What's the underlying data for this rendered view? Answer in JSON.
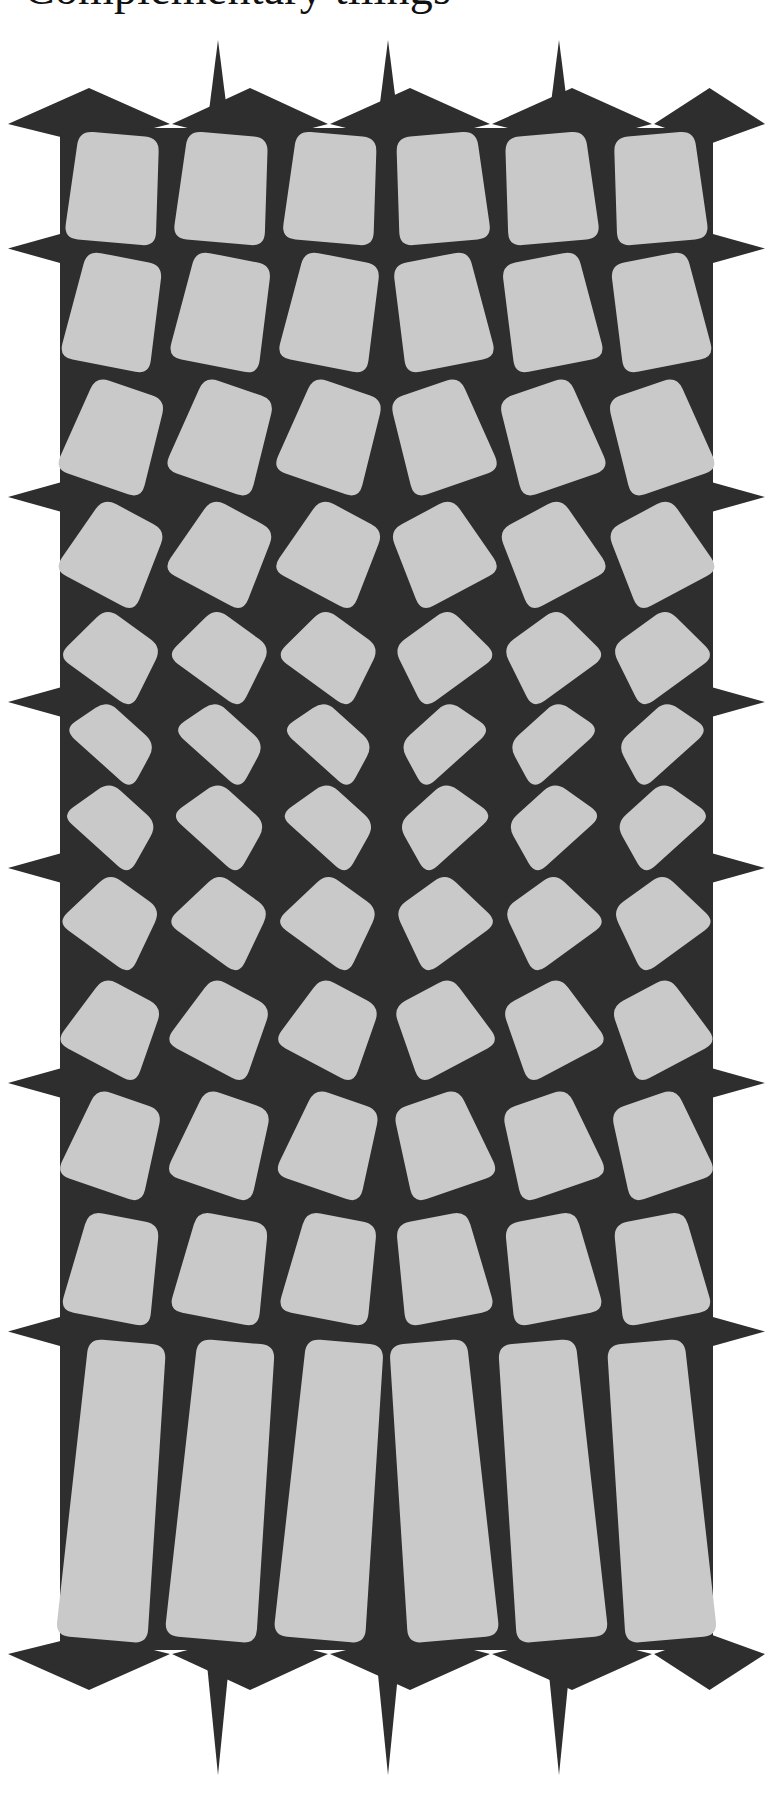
{
  "page": {
    "width": 773,
    "height": 1808,
    "background_color": "#ffffff"
  },
  "header": {
    "running_title": "Complementary tilings",
    "clipped": true,
    "note": "Only the bottom few pixels of the serif title line are visible at the top edge of the page."
  },
  "figure": {
    "name": "complementary-tiling-diagram",
    "colors": {
      "tile": "#c9c9c9",
      "ground": "#2e2e2e",
      "page": "#ffffff"
    },
    "geometry": {
      "columns": 6,
      "rows": 12,
      "block_left": 60,
      "block_right": 713,
      "block_top": 128,
      "block_bottom": 1650,
      "tile_corner_radius": 14,
      "vertical_symmetry_axis_y": 889,
      "horizontal_symmetry_axis_x": 386,
      "max_tile_rotation_deg": 42,
      "min_tile_rotation_deg": 4,
      "top_spike_count": 3,
      "top_spike_x": [
        218,
        388,
        559
      ],
      "top_spike_tip_y": 40,
      "bottom_spike_count": 3,
      "bottom_spike_x": [
        218,
        388,
        559
      ],
      "bottom_spike_tip_y": 1775,
      "side_diamond_count_per_side": 6,
      "left_diamond_tip_x": 8,
      "right_diamond_tip_x": 765
    },
    "chart_data": {
      "type": "diagram",
      "title": "Complementary tilings",
      "rows": 12,
      "columns": 6,
      "row_tilt_degrees": [
        5,
        11,
        19,
        28,
        36,
        42,
        42,
        36,
        28,
        19,
        11,
        5
      ],
      "row_y_centers": [
        185,
        312,
        438,
        556,
        660,
        744,
        816,
        920,
        1024,
        1142,
        1268,
        1395
      ],
      "legend": [
        "tile",
        "ground"
      ],
      "grid": false
    }
  }
}
